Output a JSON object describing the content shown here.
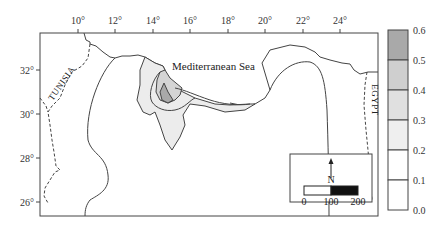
{
  "map": {
    "title_label": "Mediterranean Sea",
    "countries": {
      "west": "TUNISIA",
      "east": "EGYPT"
    },
    "lon_ticks": [
      "10°",
      "12°",
      "14°",
      "16°",
      "18°",
      "20°",
      "22°",
      "24°"
    ],
    "lat_ticks": [
      "32°",
      "30°",
      "28°",
      "26°"
    ],
    "north_label": "N",
    "scale_bar": {
      "labels": [
        "0",
        "100",
        "200"
      ]
    }
  },
  "legend": {
    "labels": [
      "0.6",
      "0.5",
      "0.4",
      "0.3",
      "0.2",
      "0.1",
      "0.0"
    ],
    "colors": {
      "0.5-0.6": "#a9a9a9",
      "0.4-0.5": "#cfcfcf",
      "0.3-0.4": "#e0e0e0",
      "0.2-0.3": "#efefef",
      "0.1-0.2": "#ffffff",
      "0.0-0.1": "#ffffff"
    }
  }
}
